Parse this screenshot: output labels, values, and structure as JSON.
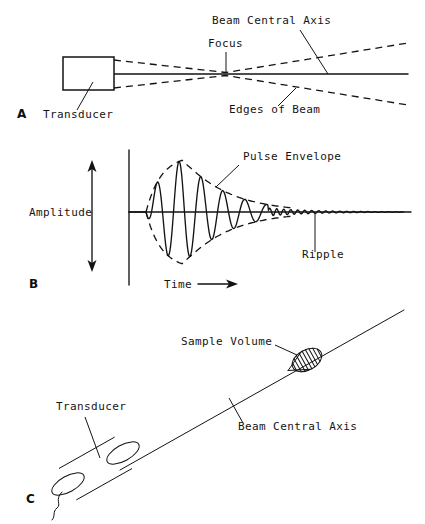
{
  "figure": {
    "background_color": "#ffffff",
    "ink_color": "#131313",
    "width": 425,
    "height": 524
  },
  "panels": [
    {
      "id": "A",
      "letter": "A",
      "letter_pos": {
        "x": 17,
        "y": 118
      },
      "labels": [
        {
          "name": "beam-central-axis",
          "text": "Beam Central Axis",
          "x": 212,
          "y": 24
        },
        {
          "name": "focus",
          "text": "Focus",
          "x": 208,
          "y": 47
        },
        {
          "name": "transducer",
          "text": "Transducer",
          "x": 43,
          "y": 118
        },
        {
          "name": "edges-of-beam",
          "text": "Edges of Beam",
          "x": 229,
          "y": 113
        }
      ],
      "geometry": {
        "axis_line": {
          "x1": 114,
          "y1": 74,
          "x2": 408,
          "y2": 74
        },
        "transducer_box": {
          "x": 63,
          "y": 57,
          "w": 51,
          "h": 33
        },
        "focus_x": 226,
        "edge_upper": "M114,60 L226,72.5 L408,43",
        "edge_lower": "M114,88 L226,75.5 L408,105",
        "leaders": [
          {
            "name": "leader-beam-central-axis",
            "x1": 300,
            "y1": 30,
            "x2": 328,
            "y2": 74
          },
          {
            "name": "leader-focus",
            "x1": 226,
            "y1": 52,
            "x2": 226,
            "y2": 72
          },
          {
            "name": "leader-transducer",
            "x1": 77,
            "y1": 110,
            "x2": 93,
            "y2": 82
          },
          {
            "name": "leader-edges-of-beam",
            "x1": 278,
            "y1": 106,
            "x2": 296,
            "y2": 88
          }
        ]
      }
    },
    {
      "id": "B",
      "letter": "B",
      "letter_pos": {
        "x": 29,
        "y": 288
      },
      "labels": [
        {
          "name": "pulse-envelope",
          "text": "Pulse Envelope",
          "x": 243,
          "y": 160
        },
        {
          "name": "amplitude",
          "text": "Amplitude",
          "x": 29,
          "y": 216
        },
        {
          "name": "ripple",
          "text": "Ripple",
          "x": 302,
          "y": 258
        },
        {
          "name": "time",
          "text": "Time",
          "x": 164,
          "y": 288
        }
      ],
      "geometry": {
        "vertical_axis": {
          "x": 129,
          "y1": 150,
          "y2": 285
        },
        "baseline": {
          "x1": 129,
          "y1": 212,
          "x2": 411,
          "y2": 212
        },
        "amplitude_arrow": {
          "x": 92,
          "y_top": 160,
          "y_bottom": 272
        },
        "time_arrow": {
          "x1": 198,
          "y": 284,
          "x2": 238
        },
        "wave": {
          "start_x": 146,
          "end_x": 404,
          "baseline_y": 212,
          "peak_x": 182,
          "peak_amplitude": 57,
          "rise_width": 36,
          "decay_tau": 42,
          "period": 22,
          "ripple_start_x": 268,
          "ripple_period": 7,
          "ripple_amplitude": 4
        },
        "leaders": [
          {
            "name": "leader-pulse-envelope",
            "x1": 239,
            "y1": 165,
            "x2": 216,
            "y2": 187
          },
          {
            "name": "leader-ripple",
            "x1": 315,
            "y1": 252,
            "x2": 315,
            "y2": 214
          }
        ]
      }
    },
    {
      "id": "C",
      "letter": "C",
      "letter_pos": {
        "x": 26,
        "y": 503
      },
      "labels": [
        {
          "name": "sample-volume",
          "text": "Sample Volume",
          "x": 181,
          "y": 345
        },
        {
          "name": "transducer",
          "text": "Transducer",
          "x": 56,
          "y": 410
        },
        {
          "name": "beam-central-axis",
          "text": "Beam Central Axis",
          "x": 238,
          "y": 430
        }
      ],
      "geometry": {
        "axis_line": {
          "x1": 120,
          "y1": 470,
          "x2": 404,
          "y2": 310
        },
        "transducer_cylinder": {
          "angle_deg": -29,
          "face_center": {
            "x": 68,
            "y": 484
          },
          "back_center": {
            "x": 123,
            "y": 453
          },
          "radius_major": 18,
          "radius_minor": 8
        },
        "cable": "M62,492 C54,500 62,504 57,508 C52,512 56,516 52,520",
        "sample_volume": {
          "center": {
            "x": 307,
            "y": 360
          },
          "radius_major": 16,
          "radius_minor": 10,
          "hatch_count": 9
        },
        "leaders": [
          {
            "name": "leader-sample-volume",
            "x1": 275,
            "y1": 345,
            "x2": 297,
            "y2": 355
          },
          {
            "name": "leader-transducer",
            "x1": 85,
            "y1": 417,
            "x2": 100,
            "y2": 458
          },
          {
            "name": "leader-beam-central-axis",
            "x1": 243,
            "y1": 423,
            "x2": 229,
            "y2": 398
          }
        ]
      }
    }
  ]
}
